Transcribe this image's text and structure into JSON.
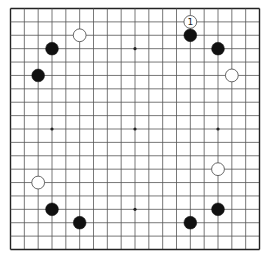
{
  "board": {
    "size": 19,
    "colors": {
      "background": "#ffffff",
      "grid_line": "#555555",
      "border": "#222222",
      "black_stone": "#111111",
      "white_stone": "#ffffff",
      "white_stone_outline": "#444444",
      "star_point": "#222222"
    },
    "star_points": [
      [
        9,
        3
      ],
      [
        3,
        9
      ],
      [
        9,
        9
      ],
      [
        15,
        9
      ],
      [
        9,
        15
      ],
      [
        3,
        3
      ],
      [
        15,
        3
      ],
      [
        3,
        15
      ],
      [
        15,
        15
      ]
    ],
    "stones": [
      {
        "color": "black",
        "col": 3,
        "row": 3
      },
      {
        "color": "white",
        "col": 5,
        "row": 2
      },
      {
        "color": "black",
        "col": 2,
        "row": 5
      },
      {
        "color": "white",
        "col": 13,
        "row": 1,
        "label": "1"
      },
      {
        "color": "black",
        "col": 13,
        "row": 2
      },
      {
        "color": "black",
        "col": 15,
        "row": 3
      },
      {
        "color": "white",
        "col": 16,
        "row": 5
      },
      {
        "color": "white",
        "col": 2,
        "row": 13
      },
      {
        "color": "black",
        "col": 3,
        "row": 15
      },
      {
        "color": "black",
        "col": 5,
        "row": 16
      },
      {
        "color": "white",
        "col": 15,
        "row": 12
      },
      {
        "color": "black",
        "col": 15,
        "row": 15
      },
      {
        "color": "black",
        "col": 13,
        "row": 16
      }
    ]
  }
}
